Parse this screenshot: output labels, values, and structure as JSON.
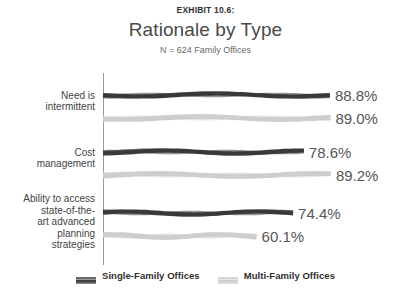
{
  "header": {
    "exhibit_label": "EXHIBIT 10.6:",
    "title": "Rationale by Type",
    "subtitle": "N = 624 Family Offices"
  },
  "colors": {
    "single_family": "#3a3a3a",
    "multi_family": "#cdcdcd",
    "axis": "#9a9a9a",
    "value_text": "#565656",
    "title_text": "#4a4a4a",
    "background": "#ffffff"
  },
  "legend": {
    "items": [
      {
        "label": "Single-Family Offices",
        "color": "#3a3a3a"
      },
      {
        "label": "Multi-Family Offices",
        "color": "#cdcdcd"
      }
    ]
  },
  "chart_data": {
    "type": "bar",
    "orientation": "horizontal",
    "title": "Rationale by Type",
    "subtitle": "N = 624 Family Offices",
    "xlabel": "",
    "ylabel": "",
    "xlim": [
      0,
      100
    ],
    "grid": false,
    "legend_position": "bottom",
    "categories": [
      "Need is intermittent",
      "Cost management",
      "Ability to access state-of-the-art advanced planning strategies"
    ],
    "category_label_lines": [
      [
        "Need is",
        "intermittent"
      ],
      [
        "Cost",
        "management"
      ],
      [
        "Ability to access",
        "state-of-the-",
        "art advanced",
        "planning",
        "strategies"
      ]
    ],
    "series": [
      {
        "name": "Single-Family Offices",
        "color": "#3a3a3a",
        "values": [
          88.8,
          78.6,
          74.4
        ],
        "labels": [
          "88.8%",
          "78.6%",
          "74.4%"
        ]
      },
      {
        "name": "Multi-Family Offices",
        "color": "#cdcdcd",
        "values": [
          89.0,
          89.2,
          60.1
        ],
        "labels": [
          "89.0%",
          "89.2%",
          "60.1%"
        ]
      }
    ]
  }
}
